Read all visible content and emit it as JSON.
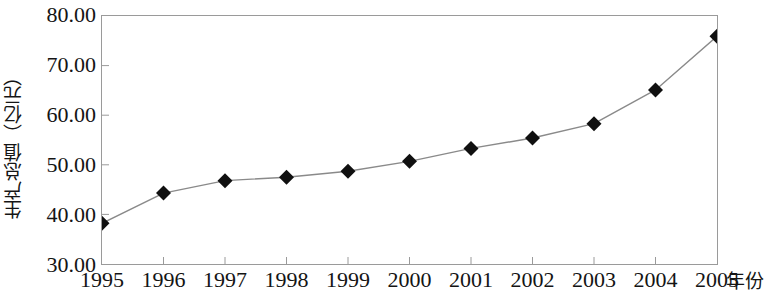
{
  "chart_data": {
    "type": "line",
    "title": "",
    "xlabel": "年份",
    "ylabel": "生产总值（亿元）",
    "categories": [
      "1995",
      "1996",
      "1997",
      "1998",
      "1999",
      "2000",
      "2001",
      "2002",
      "2003",
      "2004",
      "2005"
    ],
    "values": [
      38.2,
      44.3,
      46.8,
      47.5,
      48.7,
      50.7,
      53.3,
      55.4,
      58.3,
      65.1,
      75.9
    ],
    "series": [
      {
        "name": "生产总值",
        "values": [
          38.2,
          44.3,
          46.8,
          47.5,
          48.7,
          50.7,
          53.3,
          55.4,
          58.3,
          65.1,
          75.9
        ],
        "marker": "diamond",
        "marker_color": "#101010",
        "line_color": "#8a8a8a"
      }
    ],
    "ylim": [
      30.0,
      80.0
    ],
    "yticks": [
      30.0,
      40.0,
      50.0,
      60.0,
      70.0,
      80.0
    ],
    "ytick_labels": [
      "30.00",
      "40.00",
      "50.00",
      "60.00",
      "70.00",
      "80.00"
    ],
    "grid": false,
    "legend": null,
    "legend_position": "none",
    "plot_border": true,
    "colors": {
      "line": "#8a8a8a",
      "marker": "#101010",
      "axis": "#9a9a9a",
      "text": "#141414",
      "background": "#ffffff"
    }
  }
}
